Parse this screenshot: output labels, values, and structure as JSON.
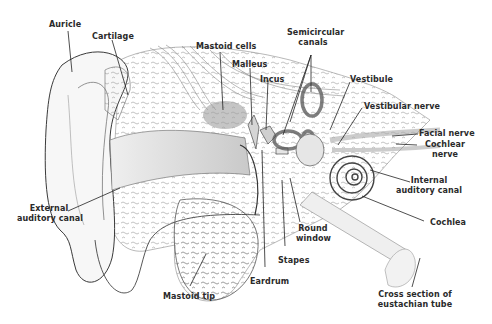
{
  "diagram": {
    "colors": {
      "background": "#ffffff",
      "ink": "#2a2a2a",
      "shade": "#b8b8b8",
      "light_shade": "#e2e2e2"
    },
    "labels": {
      "auricle": "Auricle",
      "cartilage": "Cartilage",
      "mastoid_cells": "Mastoid cells",
      "malleus": "Malleus",
      "incus": "Incus",
      "semicircular_canals_1": "Semicircular",
      "semicircular_canals_2": "canals",
      "vestibule": "Vestibule",
      "vestibular_nerve": "Vestibular nerve",
      "facial_nerve": "Facial nerve",
      "cochlear_nerve_1": "Cochlear",
      "cochlear_nerve_2": "nerve",
      "internal_auditory_canal_1": "Internal",
      "internal_auditory_canal_2": "auditory canal",
      "cochlea": "Cochlea",
      "external_auditory_canal_1": "External",
      "external_auditory_canal_2": "auditory canal",
      "round_window_1": "Round",
      "round_window_2": "window",
      "stapes": "Stapes",
      "eardrum": "Eardrum",
      "mastoid_tip": "Mastoid tip",
      "eustachian_1": "Cross section of",
      "eustachian_2": "eustachian tube"
    }
  }
}
